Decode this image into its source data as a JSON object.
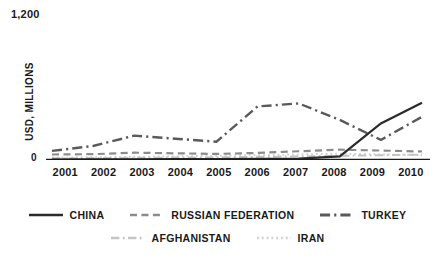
{
  "chart_data": {
    "type": "line",
    "title": "",
    "xlabel": "",
    "ylabel": "USD, MILLIONS",
    "x": [
      "2001",
      "2002",
      "2003",
      "2004",
      "2005",
      "2006",
      "2007",
      "2008",
      "2009",
      "2010"
    ],
    "ylim": [
      0,
      1200
    ],
    "ytick_labels": [
      "1,200",
      "0"
    ],
    "grid": false,
    "legend_position": "bottom",
    "series": [
      {
        "name": "CHINA",
        "color": "#2b2b2b",
        "style": "solid",
        "width": 2.2,
        "values": [
          4,
          5,
          6,
          7,
          8,
          10,
          12,
          30,
          300,
          470
        ]
      },
      {
        "name": "RUSSIAN FEDERATION",
        "color": "#8c8c8c",
        "style": "dashed",
        "width": 2.2,
        "values": [
          45,
          48,
          60,
          55,
          50,
          58,
          72,
          85,
          78,
          70
        ]
      },
      {
        "name": "TURKEY",
        "color": "#5a5a5a",
        "style": "dashdot",
        "width": 2.4,
        "values": [
          75,
          115,
          200,
          175,
          150,
          440,
          465,
          330,
          165,
          355
        ]
      },
      {
        "name": "AFGHANISTAN",
        "color": "#c4c4c4",
        "style": "dashdot",
        "width": 2.0,
        "values": [
          14,
          16,
          18,
          20,
          22,
          26,
          30,
          34,
          40,
          44
        ]
      },
      {
        "name": "IRAN",
        "color": "#cfcfcf",
        "style": "dotted",
        "width": 2.0,
        "values": [
          20,
          22,
          26,
          30,
          34,
          40,
          46,
          52,
          46,
          40
        ]
      }
    ]
  },
  "axis": {
    "y_top": "1,200",
    "y_zero": "0",
    "y_title": "USD, MILLIONS"
  },
  "legend": {
    "row1": [
      {
        "label": "CHINA"
      },
      {
        "label": "RUSSIAN FEDERATION"
      },
      {
        "label": "TURKEY"
      }
    ],
    "row2": [
      {
        "label": "AFGHANISTAN"
      },
      {
        "label": "IRAN"
      }
    ]
  }
}
